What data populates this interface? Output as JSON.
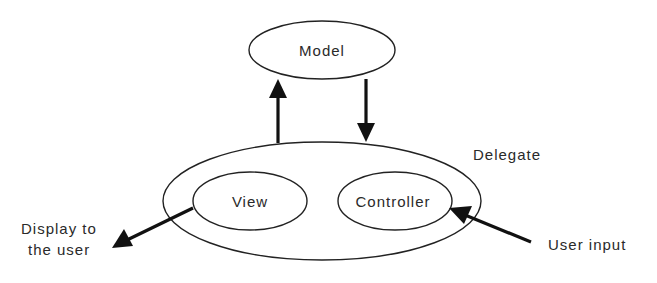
{
  "diagram": {
    "type": "mvc-delegate",
    "nodes": {
      "model": {
        "label": "Model"
      },
      "delegate": {
        "label": "Delegate"
      },
      "view": {
        "label": "View"
      },
      "controller": {
        "label": "Controller"
      }
    },
    "external_labels": {
      "display_line1": "Display to",
      "display_line2": "the user",
      "user_input": "User input"
    },
    "edges": [
      {
        "from": "delegate",
        "to": "model",
        "direction": "up"
      },
      {
        "from": "model",
        "to": "delegate",
        "direction": "down"
      },
      {
        "from": "view",
        "to": "display",
        "label_ref": "display"
      },
      {
        "from": "user_input",
        "to": "controller",
        "label_ref": "user_input"
      }
    ],
    "colors": {
      "stroke": "#222222",
      "text": "#2a2a2a",
      "background": "#ffffff"
    }
  }
}
